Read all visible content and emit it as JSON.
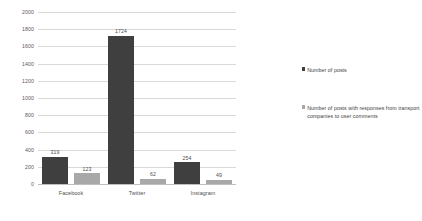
{
  "chart_data": {
    "type": "bar",
    "title": "",
    "subtitle": "",
    "xlabel": "",
    "ylabel": "",
    "categories": [
      "Facebook",
      "Twitter",
      "Instagram"
    ],
    "series": [
      {
        "name": "Number of posts",
        "color": "#3f3f3f",
        "values": [
          319,
          1724,
          254
        ],
        "labels": [
          "319",
          "1724",
          "254"
        ]
      },
      {
        "name": "Number of posts with responses from transport companies to user comments",
        "color": "#a8a8a8",
        "values": [
          123,
          62,
          49
        ],
        "labels": [
          "123",
          "62",
          "49"
        ]
      }
    ],
    "ylim": [
      0,
      2000
    ],
    "ytick_step": 200,
    "yticks": [
      "2000",
      "1800",
      "1600",
      "1400",
      "1200",
      "1000",
      "800",
      "600",
      "400",
      "200",
      "0"
    ],
    "grid": true,
    "legend_position": "right",
    "legend": [
      "Number of posts",
      "Number of posts with responses from transport companies to user comments"
    ]
  }
}
